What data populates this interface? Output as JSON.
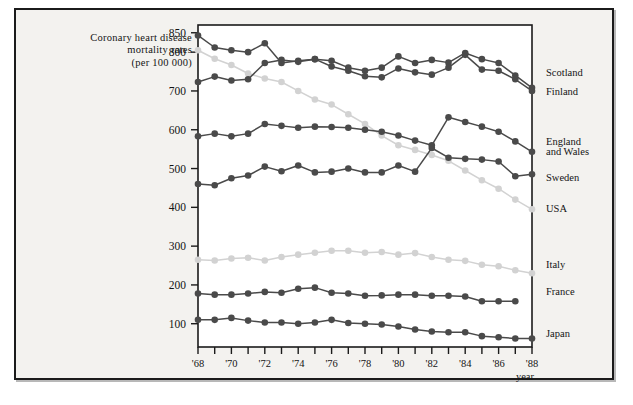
{
  "figure": {
    "title_lines": [
      "Coronary  heart  disease",
      "mortality  rates",
      "(per  100 000)"
    ],
    "caption": "",
    "panel_bg": "#f3f2ef",
    "plot_bg": "#ffffff",
    "frame_color": "#1b1b1b",
    "dark_series_color": "#4a4a4a",
    "light_series_color": "#d2d2d2"
  },
  "chart_data": {
    "type": "line",
    "title": "Coronary heart disease mortality rates (per 100 000)",
    "xlabel": "year",
    "ylabel": "",
    "xlim": [
      1968,
      1988
    ],
    "ylim": [
      40,
      870
    ],
    "grid": false,
    "legend_position": "right",
    "x": [
      1968,
      1969,
      1970,
      1971,
      1972,
      1973,
      1974,
      1975,
      1976,
      1977,
      1978,
      1979,
      1980,
      1981,
      1982,
      1983,
      1984,
      1985,
      1986,
      1987,
      1988
    ],
    "xticklabels": [
      "'68",
      "",
      "'70",
      "",
      "'72",
      "",
      "'74",
      "",
      "'76",
      "",
      "'78",
      "",
      "'80",
      "",
      "'82",
      "",
      "'84",
      "",
      "'86",
      "",
      "'88"
    ],
    "yticks": [
      100,
      200,
      300,
      400,
      500,
      600,
      700,
      800,
      850
    ],
    "yticklabels": [
      "100",
      "200",
      "300",
      "400",
      "500",
      "600",
      "700",
      "800",
      "850"
    ],
    "series": [
      {
        "name": "Scotland",
        "color": "#4a4a4a",
        "label_x": 1988,
        "values": [
          843,
          812,
          805,
          800,
          823,
          772,
          778,
          782,
          778,
          760,
          752,
          760,
          789,
          772,
          780,
          773,
          798,
          782,
          772,
          740,
          708
        ]
      },
      {
        "name": "Finland",
        "color": "#4a4a4a",
        "label_x": 1988,
        "values": [
          723,
          737,
          727,
          730,
          772,
          780,
          775,
          782,
          763,
          752,
          738,
          735,
          758,
          748,
          742,
          760,
          793,
          755,
          752,
          730,
          700
        ]
      },
      {
        "name": "England and Wales",
        "color": "#4a4a4a",
        "label_x": 1988,
        "values": [
          583,
          590,
          583,
          590,
          615,
          610,
          605,
          608,
          607,
          605,
          600,
          595,
          585,
          572,
          560,
          632,
          620,
          608,
          595,
          570,
          543
        ]
      },
      {
        "name": "Sweden",
        "color": "#4a4a4a",
        "label_x": 1988,
        "values": [
          460,
          457,
          475,
          482,
          505,
          493,
          508,
          490,
          492,
          500,
          490,
          490,
          508,
          492,
          553,
          528,
          525,
          523,
          518,
          480,
          485
        ]
      },
      {
        "name": "USA",
        "color": "#d2d2d2",
        "label_x": 1988,
        "values": [
          805,
          783,
          767,
          745,
          732,
          723,
          700,
          678,
          665,
          640,
          615,
          585,
          560,
          548,
          535,
          520,
          495,
          470,
          448,
          420,
          395
        ]
      },
      {
        "name": "Italy",
        "color": "#d2d2d2",
        "label_x": 1988,
        "values": [
          265,
          263,
          268,
          270,
          263,
          272,
          278,
          283,
          288,
          288,
          283,
          285,
          278,
          282,
          272,
          265,
          262,
          252,
          248,
          238,
          230
        ]
      },
      {
        "name": "France",
        "color": "#4a4a4a",
        "label_x": 1987,
        "values": [
          178,
          175,
          175,
          178,
          182,
          180,
          190,
          193,
          180,
          178,
          172,
          173,
          175,
          175,
          172,
          172,
          170,
          158,
          158,
          158,
          null
        ]
      },
      {
        "name": "Japan",
        "color": "#4a4a4a",
        "label_x": 1988,
        "values": [
          110,
          110,
          115,
          108,
          103,
          103,
          100,
          103,
          110,
          102,
          100,
          98,
          93,
          85,
          80,
          78,
          78,
          68,
          65,
          62,
          62
        ]
      }
    ]
  },
  "legend": {
    "entries": [
      {
        "label": "Scotland",
        "y_value": 748
      },
      {
        "label": "Finland",
        "y_value": 700
      },
      {
        "label": "England",
        "y_value": 572
      },
      {
        "label": "and  Wales",
        "y_value": 545
      },
      {
        "label": "Sweden",
        "y_value": 478
      },
      {
        "label": "USA",
        "y_value": 398
      },
      {
        "label": "Italy",
        "y_value": 255
      },
      {
        "label": "France",
        "y_value": 185
      },
      {
        "label": "Japan",
        "y_value": 75
      }
    ]
  },
  "axis": {
    "x_name": "year"
  }
}
